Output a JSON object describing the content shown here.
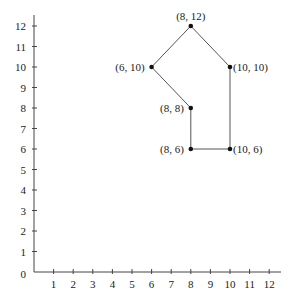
{
  "chart_data": {
    "type": "scatter",
    "title": "",
    "xlabel": "",
    "ylabel": "",
    "xlim": [
      0,
      12
    ],
    "ylim": [
      0,
      12
    ],
    "grid": false,
    "legend": null,
    "x_ticks": [
      1,
      2,
      3,
      4,
      5,
      6,
      7,
      8,
      9,
      10,
      11,
      12
    ],
    "y_ticks": [
      0,
      1,
      2,
      3,
      4,
      5,
      6,
      7,
      8,
      9,
      10,
      11,
      12
    ],
    "points": [
      {
        "x": 8,
        "y": 12,
        "label": "(8, 12)",
        "label_pos": "above"
      },
      {
        "x": 10,
        "y": 10,
        "label": "(10, 10)",
        "label_pos": "right"
      },
      {
        "x": 10,
        "y": 6,
        "label": "(10, 6)",
        "label_pos": "right"
      },
      {
        "x": 8,
        "y": 6,
        "label": "(8, 6)",
        "label_pos": "left"
      },
      {
        "x": 8,
        "y": 8,
        "label": "(8, 8)",
        "label_pos": "left"
      },
      {
        "x": 6,
        "y": 10,
        "label": "(6, 10)",
        "label_pos": "left"
      }
    ],
    "polygon": {
      "closed": true,
      "vertices": [
        [
          8,
          12
        ],
        [
          10,
          10
        ],
        [
          10,
          6
        ],
        [
          8,
          6
        ],
        [
          8,
          8
        ],
        [
          6,
          10
        ]
      ]
    }
  },
  "style": {
    "axis_color": "#444444",
    "line_color": "#555555",
    "point_color": "#111111"
  }
}
